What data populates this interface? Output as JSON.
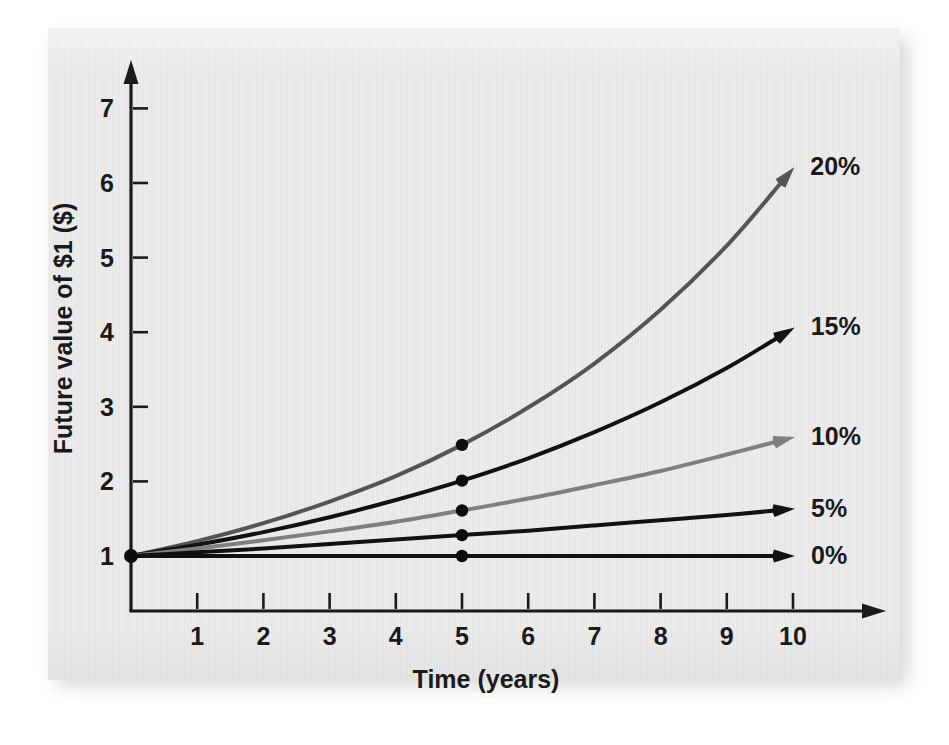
{
  "chart_data": {
    "type": "line",
    "title": "",
    "xlabel": "Time (years)",
    "ylabel": "Future value of $1 ($)",
    "xlim": [
      0,
      10.6
    ],
    "ylim": [
      0,
      7.6
    ],
    "xticks": [
      "1",
      "2",
      "3",
      "4",
      "5",
      "6",
      "7",
      "8",
      "9",
      "10"
    ],
    "xtick_values": [
      1,
      2,
      3,
      4,
      5,
      6,
      7,
      8,
      9,
      10
    ],
    "yticks": [
      "1",
      "2",
      "3",
      "4",
      "5",
      "6",
      "7"
    ],
    "ytick_values": [
      1,
      2,
      3,
      4,
      5,
      6,
      7
    ],
    "grid": false,
    "legend_position": "right-of-curve-ends",
    "origin_marker_value": 1,
    "marker_year": 5,
    "series": [
      {
        "name": "20%",
        "label": "20%",
        "color": "#555555",
        "rate": 0.2,
        "x": [
          0,
          1,
          2,
          3,
          4,
          5,
          6,
          7,
          8,
          9,
          10
        ],
        "values": [
          1.0,
          1.2,
          1.44,
          1.73,
          2.07,
          2.49,
          2.99,
          3.58,
          4.3,
          5.16,
          6.19
        ],
        "marker_at_year5": 2.49,
        "end_value": 6.19
      },
      {
        "name": "15%",
        "label": "15%",
        "color": "#111111",
        "rate": 0.15,
        "x": [
          0,
          1,
          2,
          3,
          4,
          5,
          6,
          7,
          8,
          9,
          10
        ],
        "values": [
          1.0,
          1.15,
          1.32,
          1.52,
          1.75,
          2.01,
          2.31,
          2.66,
          3.06,
          3.52,
          4.05
        ],
        "marker_at_year5": 2.01,
        "end_value": 4.05
      },
      {
        "name": "10%",
        "label": "10%",
        "color": "#7f7f7f",
        "rate": 0.1,
        "x": [
          0,
          1,
          2,
          3,
          4,
          5,
          6,
          7,
          8,
          9,
          10
        ],
        "values": [
          1.0,
          1.1,
          1.21,
          1.33,
          1.46,
          1.61,
          1.77,
          1.95,
          2.14,
          2.36,
          2.59
        ],
        "marker_at_year5": 1.61,
        "end_value": 2.59
      },
      {
        "name": "5%",
        "label": "5%",
        "color": "#111111",
        "rate": 0.05,
        "x": [
          0,
          1,
          2,
          3,
          4,
          5,
          6,
          7,
          8,
          9,
          10
        ],
        "values": [
          1.0,
          1.05,
          1.1,
          1.16,
          1.22,
          1.28,
          1.34,
          1.41,
          1.48,
          1.55,
          1.63
        ],
        "marker_at_year5": 1.28,
        "end_value": 1.63
      },
      {
        "name": "0%",
        "label": "0%",
        "color": "#111111",
        "rate": 0.0,
        "x": [
          0,
          1,
          2,
          3,
          4,
          5,
          6,
          7,
          8,
          9,
          10
        ],
        "values": [
          1.0,
          1.0,
          1.0,
          1.0,
          1.0,
          1.0,
          1.0,
          1.0,
          1.0,
          1.0,
          1.0
        ],
        "marker_at_year5": 1.0,
        "end_value": 1.0
      }
    ]
  },
  "axes": {
    "x_axis_name": "time-axis",
    "y_axis_name": "value-axis"
  },
  "colors": {
    "panel_background": "#e9e9e9",
    "page_background": "#ffffff",
    "axis": "#1a1a1a",
    "text": "#1a1a1a"
  }
}
